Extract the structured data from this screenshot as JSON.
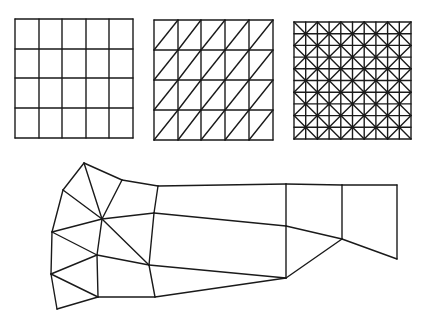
{
  "figure": {
    "width": 423,
    "height": 326,
    "background": "#ffffff",
    "stroke_color": "#1a1a1a",
    "stroke_width": 1.4
  },
  "meshes": {
    "quad_grid": {
      "label": "structured quadrilateral mesh",
      "x_lines": [
        15,
        39,
        62,
        86,
        109,
        133
      ],
      "y_lines": [
        19,
        49,
        78,
        108,
        138
      ],
      "diagonals": "none"
    },
    "triangle_grid": {
      "label": "structured triangular mesh",
      "x_lines": [
        154,
        178,
        201,
        225,
        249,
        273
      ],
      "y_lines": [
        20,
        50,
        80,
        110,
        140
      ],
      "diagonals": "bottom-left-to-top-right"
    },
    "union_jack_grid": {
      "label": "criss-cross triangular mesh",
      "x0": 294,
      "y0": 22,
      "size": 117,
      "divisions": 10,
      "diagonals": "alternating-checkerboard"
    },
    "unstructured_mesh": {
      "label": "unstructured mixed mesh",
      "nodes": {
        "A": [
          84,
          163
        ],
        "B": [
          63,
          190
        ],
        "C": [
          122,
          180
        ],
        "D": [
          158,
          186
        ],
        "E": [
          102,
          219
        ],
        "F": [
          52,
          232
        ],
        "G": [
          154,
          213
        ],
        "H": [
          97,
          255
        ],
        "I": [
          149,
          265
        ],
        "J": [
          51,
          274
        ],
        "K": [
          98,
          297
        ],
        "L": [
          155,
          297
        ],
        "M": [
          57,
          309
        ],
        "N": [
          286,
          184
        ],
        "O": [
          286,
          226
        ],
        "P": [
          286,
          278
        ],
        "Q": [
          342,
          185
        ],
        "R": [
          342,
          239
        ],
        "S": [
          397,
          185
        ],
        "T": [
          397,
          259
        ]
      },
      "edges": [
        [
          "A",
          "B"
        ],
        [
          "A",
          "C"
        ],
        [
          "A",
          "E"
        ],
        [
          "B",
          "E"
        ],
        [
          "B",
          "F"
        ],
        [
          "C",
          "E"
        ],
        [
          "C",
          "D"
        ],
        [
          "D",
          "G"
        ],
        [
          "E",
          "G"
        ],
        [
          "E",
          "F"
        ],
        [
          "E",
          "H"
        ],
        [
          "E",
          "I"
        ],
        [
          "F",
          "H"
        ],
        [
          "F",
          "J"
        ],
        [
          "H",
          "J"
        ],
        [
          "H",
          "I"
        ],
        [
          "H",
          "K"
        ],
        [
          "J",
          "K"
        ],
        [
          "J",
          "M"
        ],
        [
          "M",
          "K"
        ],
        [
          "K",
          "L"
        ],
        [
          "I",
          "L"
        ],
        [
          "G",
          "I"
        ],
        [
          "D",
          "N"
        ],
        [
          "G",
          "O"
        ],
        [
          "I",
          "P"
        ],
        [
          "L",
          "P"
        ],
        [
          "N",
          "O"
        ],
        [
          "O",
          "P"
        ],
        [
          "N",
          "Q"
        ],
        [
          "O",
          "R"
        ],
        [
          "P",
          "R"
        ],
        [
          "Q",
          "R"
        ],
        [
          "Q",
          "S"
        ],
        [
          "R",
          "T"
        ],
        [
          "S",
          "T"
        ]
      ]
    }
  }
}
